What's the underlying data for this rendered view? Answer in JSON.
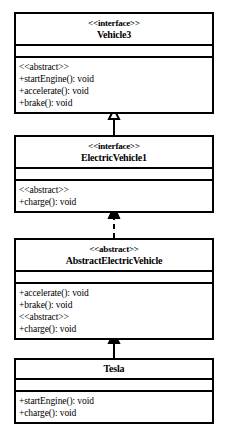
{
  "diagram": {
    "type": "uml-class-diagram",
    "classes": [
      {
        "id": "vehicle3",
        "stereotype": "<<interface>>",
        "name": "Vehicle3",
        "attributes": [],
        "operations": [
          "<<abstract>>",
          "+startEngine(): void",
          "+accelerate(): void",
          "+brake(): void"
        ]
      },
      {
        "id": "electricvehicle1",
        "stereotype": "<<interface>>",
        "name": "ElectricVehicle1",
        "attributes": [],
        "operations": [
          "<<abstract>>",
          "+charge(): void"
        ]
      },
      {
        "id": "abstractelectricvehicle",
        "stereotype": "<<abstract>>",
        "name": "AbstractElectricVehicle",
        "attributes": [],
        "operations": [
          "+accelerate(): void",
          "+brake(): void",
          "<<abstract>>",
          "+charge(): void"
        ]
      },
      {
        "id": "tesla",
        "stereotype": "",
        "name": "Tesla",
        "attributes": [],
        "operations": [
          "+startEngine(): void",
          "+charge(): void"
        ]
      }
    ],
    "relationships": [
      {
        "from": "electricvehicle1",
        "to": "vehicle3",
        "style": "solid",
        "arrow": "hollow-triangle",
        "kind": "generalization"
      },
      {
        "from": "abstractelectricvehicle",
        "to": "electricvehicle1",
        "style": "dashed",
        "arrow": "hollow-triangle",
        "kind": "realization"
      },
      {
        "from": "tesla",
        "to": "abstractelectricvehicle",
        "style": "solid",
        "arrow": "hollow-triangle",
        "kind": "generalization"
      }
    ],
    "colors": {
      "line": "#000000",
      "fill": "#ffffff",
      "text": "#000000"
    }
  }
}
